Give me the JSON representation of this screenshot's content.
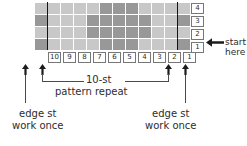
{
  "chart_data": {
    "type": "heatmap",
    "rows": 4,
    "columns": 12,
    "legend": {
      "light": "#c8c8c8",
      "dark": "#989898"
    },
    "row_labels_top_to_bottom": [
      "4",
      "3",
      "2",
      "1"
    ],
    "column_labels_left_to_right": [
      "10",
      "9",
      "8",
      "7",
      "6",
      "5",
      "4",
      "3",
      "2",
      "1"
    ],
    "grid_top_to_bottom": [
      [
        "light",
        "light",
        "light",
        "light",
        "light",
        "dark",
        "dark",
        "dark",
        "light",
        "light",
        "light",
        "light"
      ],
      [
        "dark",
        "light",
        "light",
        "light",
        "dark",
        "dark",
        "dark",
        "dark",
        "dark",
        "light",
        "light",
        "dark"
      ],
      [
        "light",
        "light",
        "light",
        "light",
        "dark",
        "dark",
        "dark",
        "dark",
        "dark",
        "light",
        "light",
        "light"
      ],
      [
        "dark",
        "light",
        "light",
        "light",
        "light",
        "dark",
        "dark",
        "dark",
        "light",
        "light",
        "light",
        "dark"
      ]
    ],
    "repeat_boundary_columns": [
      1,
      11
    ],
    "annotations": {
      "start_here": "start\nhere",
      "repeat_line1": "10-st",
      "repeat_line2": "pattern repeat",
      "edge_left": "edge st\nwork once",
      "edge_right": "edge st\nwork once"
    }
  },
  "labels": {
    "start_here_line1": "start",
    "start_here_line2": "here",
    "repeat_count": "10-st",
    "repeat_text": "pattern repeat",
    "edge_left_line1": "edge st",
    "edge_left_line2": "work once",
    "edge_right_line1": "edge st",
    "edge_right_line2": "work once"
  },
  "colors": {
    "cell_light": "#c8c8c8",
    "cell_dark": "#989898",
    "repeat_line": "#141414",
    "text": "#2d2d2d"
  }
}
